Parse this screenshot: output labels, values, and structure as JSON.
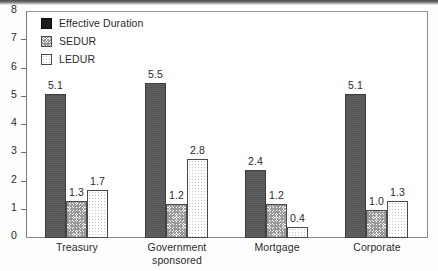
{
  "chart_data": {
    "type": "bar",
    "title": "",
    "xlabel": "",
    "ylabel": "",
    "ylim": [
      0,
      8
    ],
    "yticks": [
      "0",
      "1",
      "2",
      "3",
      "4",
      "5",
      "6",
      "7",
      "8"
    ],
    "grid": false,
    "legend_position": "top-left",
    "categories": [
      "Treasury",
      "Government sponsored",
      "Mortgage",
      "Corporate"
    ],
    "category_lines": [
      [
        "Treasury"
      ],
      [
        "Government",
        "sponsored"
      ],
      [
        "Mortgage"
      ],
      [
        "Corporate"
      ]
    ],
    "series": [
      {
        "name": "Effective Duration",
        "pattern": "solid-dark",
        "color": "#58585a",
        "values": [
          5.1,
          5.5,
          2.4,
          5.1
        ],
        "labels": [
          "5.1",
          "5.5",
          "2.4",
          "5.1"
        ]
      },
      {
        "name": "SEDUR",
        "pattern": "crosshatch",
        "color": "#9a9a9c",
        "values": [
          1.3,
          1.2,
          1.2,
          1.0
        ],
        "labels": [
          "1.3",
          "1.2",
          "1.2",
          "1.0"
        ]
      },
      {
        "name": "LEDUR",
        "pattern": "dotted-light",
        "color": "#ffffff",
        "values": [
          1.7,
          2.8,
          0.4,
          1.3
        ],
        "labels": [
          "1.7",
          "2.8",
          "0.4",
          "1.3"
        ]
      }
    ]
  },
  "legend": {
    "items": [
      {
        "label": "Effective Duration"
      },
      {
        "label": "SEDUR"
      },
      {
        "label": "LEDUR"
      }
    ]
  },
  "axis": {
    "y_labels": [
      "8",
      "7",
      "6",
      "5",
      "4",
      "3",
      "2",
      "1",
      "0"
    ]
  }
}
